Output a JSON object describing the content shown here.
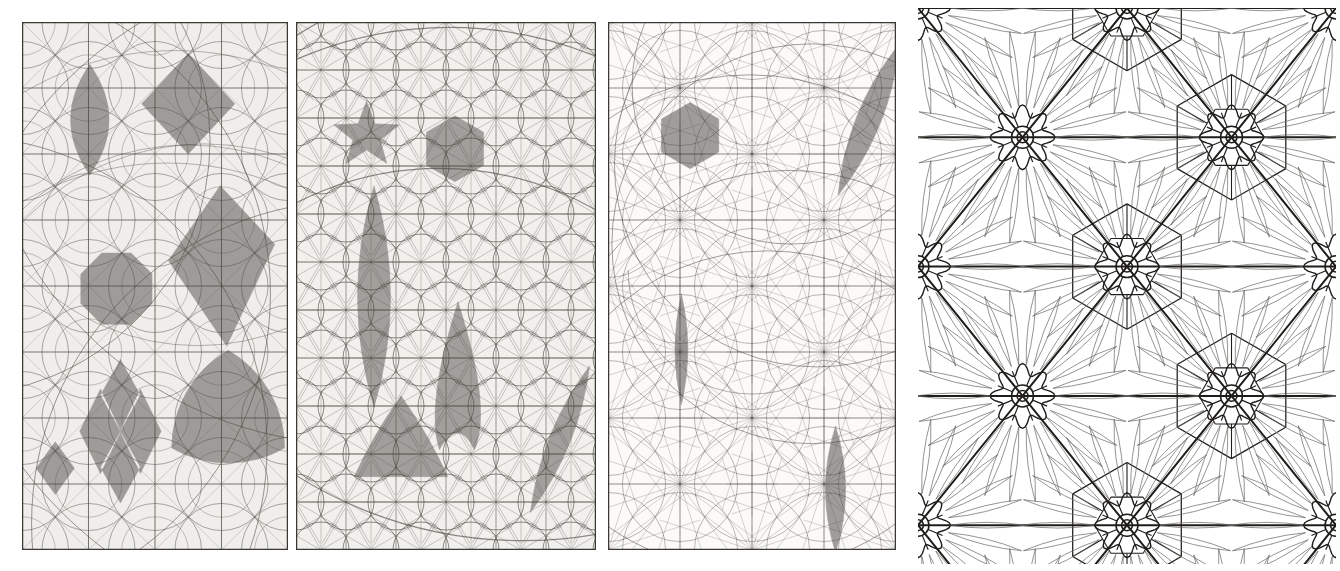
{
  "plate": {
    "title": "Geometric construction plate",
    "description": "Four-panel engraved plate of compass-and-straightedge geometric constructions with shaded polygonal regions and a floral rosette tessellation",
    "background_color": "#ffffff",
    "width": 1340,
    "height": 571
  },
  "panels": [
    {
      "id": "panel-1",
      "name": "construction-grid-square-lattice",
      "x": 22,
      "y": 22,
      "width": 266,
      "height": 528,
      "paper_color": "#efeeea",
      "line_color": "#4a4742",
      "shade_color": "#9a9894",
      "border_color": "#3a3833",
      "grid": {
        "type": "square",
        "cols": 4,
        "rows": 8,
        "arcs": true,
        "arc_families": 6
      },
      "shapes": [
        {
          "name": "vertical-lens",
          "type": "lens-vertical",
          "cx": 0.255,
          "cy": 0.185,
          "rx": 0.145,
          "ry": 0.105
        },
        {
          "name": "upper-right-rhombus",
          "type": "rhombus",
          "cx": 0.625,
          "cy": 0.155,
          "rx": 0.175,
          "ry": 0.095
        },
        {
          "name": "right-kite",
          "type": "kite",
          "cx": 0.745,
          "cy": 0.445,
          "rx": 0.205,
          "ry": 0.135
        },
        {
          "name": "octagon-disk",
          "type": "octagon",
          "cx": 0.355,
          "cy": 0.505,
          "r": 0.145
        },
        {
          "name": "large-reuleaux-triangle",
          "type": "reuleaux",
          "cx": 0.775,
          "cy": 0.745,
          "r": 0.245
        },
        {
          "name": "bowtie-pair",
          "type": "bowtie",
          "cx": 0.37,
          "cy": 0.775,
          "rx": 0.15,
          "ry": 0.08
        },
        {
          "name": "small-rhombus",
          "type": "rhombus",
          "cx": 0.125,
          "cy": 0.845,
          "rx": 0.072,
          "ry": 0.05
        }
      ]
    },
    {
      "id": "panel-2",
      "name": "construction-grid-hex-lattice",
      "x": 296,
      "y": 22,
      "width": 300,
      "height": 528,
      "paper_color": "#f1f0ec",
      "line_color": "#4a4742",
      "shade_color": "#9d9b97",
      "border_color": "#3a3833",
      "grid": {
        "type": "triangular-hexagonal",
        "cols": 6,
        "rows": 10,
        "arcs": true,
        "arc_families": 4
      },
      "shapes": [
        {
          "name": "five-point-star",
          "type": "star",
          "cx": 0.235,
          "cy": 0.215,
          "r": 0.115,
          "points": 5
        },
        {
          "name": "hexagon",
          "type": "hexagon",
          "cx": 0.53,
          "cy": 0.24,
          "r": 0.11
        },
        {
          "name": "tall-lens",
          "type": "lens-vertical",
          "cx": 0.26,
          "cy": 0.52,
          "rx": 0.11,
          "ry": 0.21
        },
        {
          "name": "cone-shape",
          "type": "cone",
          "cx": 0.54,
          "cy": 0.67,
          "rx": 0.1,
          "ry": 0.14
        },
        {
          "name": "lower-triangle",
          "type": "triangle-curved",
          "cx": 0.35,
          "cy": 0.81,
          "r": 0.18
        },
        {
          "name": "slanted-lens",
          "type": "lens-slanted",
          "cx": 0.88,
          "cy": 0.79,
          "rx": 0.07,
          "ry": 0.15
        }
      ]
    },
    {
      "id": "panel-3",
      "name": "construction-grid-radial",
      "x": 608,
      "y": 22,
      "width": 288,
      "height": 528,
      "paper_color": "#fbfaf8",
      "line_color": "#43403b",
      "shade_color": "#9b9995",
      "border_color": "#3a3833",
      "grid": {
        "type": "radial-fan",
        "cols": 4,
        "rows": 8,
        "arcs": true,
        "arc_families": 5
      },
      "shapes": [
        {
          "name": "hexagon",
          "type": "hexagon",
          "cx": 0.285,
          "cy": 0.215,
          "r": 0.115
        },
        {
          "name": "upper-right-lens",
          "type": "lens-slanted",
          "cx": 0.905,
          "cy": 0.185,
          "rx": 0.085,
          "ry": 0.155
        },
        {
          "name": "large-crescent",
          "type": "crescent",
          "cx": 0.5,
          "cy": 0.47,
          "r": 0.43
        },
        {
          "name": "mid-left-lens",
          "type": "lens-vertical",
          "cx": 0.255,
          "cy": 0.62,
          "rx": 0.045,
          "ry": 0.105
        },
        {
          "name": "lower-right-lens",
          "type": "lens-vertical",
          "cx": 0.79,
          "cy": 0.885,
          "rx": 0.07,
          "ry": 0.12
        }
      ]
    },
    {
      "id": "panel-4",
      "name": "floral-rosette-tessellation",
      "x": 918,
      "y": 8,
      "width": 418,
      "height": 556,
      "paper_color": "#ffffff",
      "line_color": "#1f1d1a",
      "petal_color": "#6c6a66",
      "border_color": "#ffffff",
      "grid": {
        "type": "rosette-lattice",
        "cols": 3,
        "rows": 4,
        "rosette_petals": 24,
        "inner_petals": 8
      },
      "shapes": [
        {
          "name": "rosette-center",
          "type": "rosette",
          "cx": 0.5,
          "cy": 0.29,
          "r": 0.21
        },
        {
          "name": "rosette-center-lower",
          "type": "rosette",
          "cx": 0.5,
          "cy": 0.72,
          "r": 0.21
        },
        {
          "name": "rosette-corner-tl",
          "type": "rosette",
          "cx": 0.105,
          "cy": 0.075,
          "r": 0.2
        },
        {
          "name": "rosette-corner-tr",
          "type": "rosette",
          "cx": 0.895,
          "cy": 0.075,
          "r": 0.2
        },
        {
          "name": "rosette-corner-bl",
          "type": "rosette",
          "cx": 0.105,
          "cy": 0.505,
          "r": 0.2
        },
        {
          "name": "rosette-corner-br",
          "type": "rosette",
          "cx": 0.895,
          "cy": 0.505,
          "r": 0.2
        },
        {
          "name": "rosette-bottom-l",
          "type": "rosette",
          "cx": 0.105,
          "cy": 0.94,
          "r": 0.2
        },
        {
          "name": "rosette-bottom-r",
          "type": "rosette",
          "cx": 0.895,
          "cy": 0.94,
          "r": 0.2
        }
      ]
    }
  ]
}
